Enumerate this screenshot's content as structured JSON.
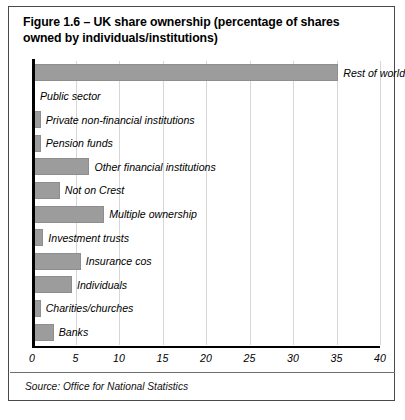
{
  "figure": {
    "title": "Figure 1.6 – UK share ownership (percentage of shares owned by individuals/institutions)",
    "source": "Source: Office for National Statistics"
  },
  "colors": {
    "bar_fill": "#9c9c9c",
    "axis": "#000000",
    "gridline": "#d6d6d6",
    "border": "#4a4a4a"
  },
  "chart_data": {
    "type": "bar",
    "orientation": "horizontal",
    "title": "Figure 1.6 – UK share ownership (percentage of shares owned by individuals/institutions)",
    "xlabel": "",
    "ylabel": "",
    "xlim": [
      0,
      40
    ],
    "xticks": [
      0,
      5,
      10,
      15,
      20,
      25,
      30,
      35,
      40
    ],
    "grid": true,
    "legend": false,
    "categories": [
      "Rest of world",
      "Public sector",
      "Private non-financial institutions",
      "Pension funds",
      "Other financial institutions",
      "Not on Crest",
      "Multiple ownership",
      "Investment trusts",
      "Insurance cos",
      "Individuals",
      "Charities/churches",
      "Banks"
    ],
    "values": [
      35.2,
      0.2,
      1.0,
      1.0,
      6.6,
      3.2,
      8.3,
      1.3,
      5.6,
      4.6,
      1.0,
      2.5
    ]
  }
}
